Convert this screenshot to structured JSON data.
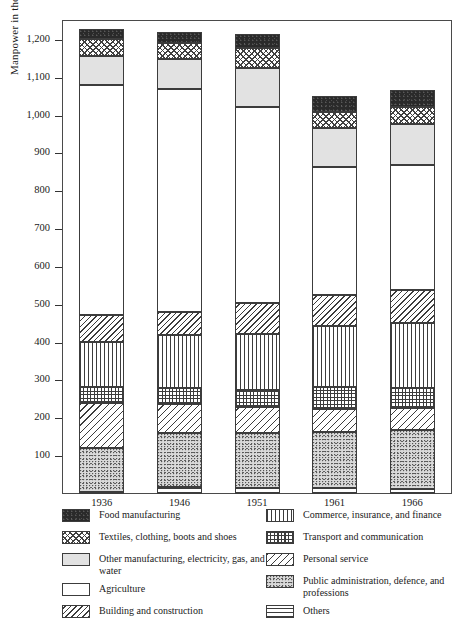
{
  "chart_data": {
    "type": "bar",
    "subtype": "stacked-bar",
    "title": "",
    "xlabel": "",
    "ylabel": "Manpower in thousands",
    "ylim": [
      0,
      1250
    ],
    "ytick_values": [
      100,
      200,
      300,
      400,
      500,
      600,
      700,
      800,
      900,
      1000,
      1100,
      1200
    ],
    "ytick_labels": [
      "100",
      "200",
      "300",
      "400",
      "500",
      "600",
      "700",
      "800",
      "900",
      "1,000",
      "1,100",
      "1,200"
    ],
    "grid": false,
    "legend_position": "below",
    "categories": [
      "1936",
      "1946",
      "1951",
      "1961",
      "1966"
    ],
    "stack_order_bottom_to_top": [
      "Others",
      "Public administration, defence, and professions",
      "Personal service",
      "Transport and communication",
      "Commerce, insurance, and finance",
      "Building and construction",
      "Agriculture",
      "Other manufacturing, electricity, gas, and water",
      "Textiles, clothing, boots and shoes",
      "Food manufacturing"
    ],
    "series": [
      {
        "name": "Others",
        "pattern": "horizontal-lines",
        "values": [
          5,
          18,
          15,
          15,
          14
        ]
      },
      {
        "name": "Public administration, defence, and professions",
        "pattern": "stipple",
        "values": [
          117,
          142,
          145,
          148,
          155
        ]
      },
      {
        "name": "Personal service",
        "pattern": "diagonal-wide",
        "values": [
          118,
          78,
          70,
          62,
          58
        ]
      },
      {
        "name": "Transport and communication",
        "pattern": "grid",
        "values": [
          42,
          42,
          45,
          58,
          52
        ]
      },
      {
        "name": "Commerce, insurance, and finance",
        "pattern": "vertical-lines",
        "values": [
          120,
          140,
          148,
          160,
          172
        ]
      },
      {
        "name": "Building and construction",
        "pattern": "diagonal-narrow",
        "values": [
          72,
          60,
          82,
          82,
          88
        ]
      },
      {
        "name": "Agriculture",
        "pattern": "solid-white",
        "values": [
          608,
          590,
          518,
          338,
          330
        ]
      },
      {
        "name": "Other manufacturing, electricity, gas, and water",
        "pattern": "light-gray",
        "values": [
          75,
          80,
          102,
          105,
          110
        ]
      },
      {
        "name": "Textiles, clothing, boots and shoes",
        "pattern": "checkered",
        "values": [
          45,
          42,
          55,
          42,
          45
        ]
      },
      {
        "name": "Food manufacturing",
        "pattern": "solid-black",
        "values": [
          28,
          28,
          36,
          42,
          44
        ]
      }
    ],
    "totals": [
      1230,
      1220,
      1216,
      1052,
      1068
    ]
  },
  "axis": {
    "y_title": "Manpower in thousands"
  },
  "legend": {
    "left_column": [
      {
        "label": "Food manufacturing",
        "pattern": "p-food"
      },
      {
        "label": "Textiles, clothing, boots and shoes",
        "pattern": "p-textiles"
      },
      {
        "label": "Other manufacturing, electricity, gas, and water",
        "pattern": "p-othermfg"
      },
      {
        "label": "Agriculture",
        "pattern": "p-agri"
      },
      {
        "label": "Building and construction",
        "pattern": "p-build"
      }
    ],
    "right_column": [
      {
        "label": "Commerce, insurance, and finance",
        "pattern": "p-commerce"
      },
      {
        "label": "Transport and communication",
        "pattern": "p-transport"
      },
      {
        "label": "Personal service",
        "pattern": "p-personal"
      },
      {
        "label": "Public administration, defence, and professions",
        "pattern": "p-public"
      },
      {
        "label": "Others",
        "pattern": "p-others"
      }
    ]
  },
  "colors": {
    "ink": "#3c3c3c",
    "food_fill": "#2a2a2a",
    "other_manufacturing_fill": "#e2e2e2",
    "public_admin_fill": "#d9d9d9",
    "background": "#ffffff"
  }
}
